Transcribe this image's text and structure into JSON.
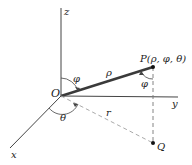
{
  "diagram": {
    "axes": {
      "z_label": "z",
      "y_label": "y",
      "x_label": "x"
    },
    "origin_label": "O",
    "point_p_label": "P(ρ, φ, θ)",
    "point_q_label": "Q",
    "rho_label": "ρ",
    "r_label": "r",
    "phi_label_top": "φ",
    "phi_label_at_p": "φ",
    "theta_label": "θ",
    "colors": {
      "axis": "#333333",
      "rho_line": "#3a3a3a",
      "dashed": "#9a9a9a",
      "text": "#222222"
    }
  }
}
